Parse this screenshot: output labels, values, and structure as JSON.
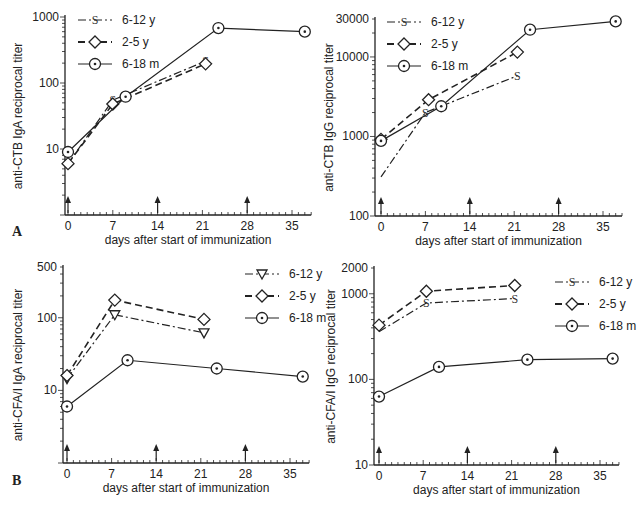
{
  "figure": {
    "panel_labels": [
      "A",
      "B"
    ],
    "shared_xlabel": "days after start of immunization",
    "x_ticks": [
      "0",
      "7",
      "14",
      "21",
      "28",
      "35"
    ],
    "immunization_arrows_days": [
      0,
      14,
      28
    ]
  },
  "chart_data": [
    {
      "id": "A-left",
      "type": "line",
      "title": "",
      "xlabel": "days after start of immunization",
      "ylabel": "anti-CTB IgA reciprocal titer",
      "yscale": "log",
      "ylim": [
        1,
        1000
      ],
      "y_ticks": [
        "1000",
        "100",
        "10"
      ],
      "xlim": [
        0,
        38
      ],
      "grid": false,
      "legend_position": "upper left",
      "series": [
        {
          "name": "6-12 y",
          "marker": "S",
          "linestyle": "dash-dot",
          "x": [
            0,
            7,
            21.5
          ],
          "values": [
            6,
            55,
            215
          ]
        },
        {
          "name": "2-5 y",
          "marker": "diamond",
          "linestyle": "dashed",
          "x": [
            0,
            7,
            21.5
          ],
          "values": [
            6,
            48,
            195
          ]
        },
        {
          "name": "6-18 m",
          "marker": "circle-dot",
          "linestyle": "solid",
          "x": [
            0,
            9,
            23.5,
            37
          ],
          "values": [
            9,
            62,
            680,
            600
          ]
        }
      ]
    },
    {
      "id": "A-right",
      "type": "line",
      "title": "",
      "xlabel": "days after start of immunization",
      "ylabel": "anti-CTB IgG reciprocal titer",
      "yscale": "log",
      "ylim": [
        100,
        30000
      ],
      "y_ticks": [
        "30000",
        "10000",
        "1000",
        "100"
      ],
      "xlim": [
        0,
        38
      ],
      "grid": false,
      "legend_position": "upper left",
      "series": [
        {
          "name": "6-12 y",
          "marker": "S",
          "linestyle": "dash-dot",
          "x": [
            0,
            7,
            21.5
          ],
          "values": [
            310,
            2000,
            5800
          ]
        },
        {
          "name": "2-5 y",
          "marker": "diamond",
          "linestyle": "dashed",
          "x": [
            0,
            7.5,
            21.5
          ],
          "values": [
            920,
            2900,
            11500
          ]
        },
        {
          "name": "6-18 m",
          "marker": "circle-dot",
          "linestyle": "solid",
          "x": [
            0,
            9.5,
            23.5,
            37
          ],
          "values": [
            880,
            2400,
            22000,
            28000
          ]
        }
      ]
    },
    {
      "id": "B-left",
      "type": "line",
      "title": "",
      "xlabel": "days after start of immunization",
      "ylabel": "anti-CFA/I IgA reciprocal titer",
      "yscale": "log",
      "ylim": [
        1,
        500
      ],
      "y_ticks": [
        "500",
        "100",
        "10"
      ],
      "xlim": [
        0,
        38
      ],
      "grid": false,
      "legend_position": "upper right",
      "series": [
        {
          "name": "6-12 y",
          "marker": "triangle-down",
          "linestyle": "dash-dot",
          "x": [
            0,
            7.5,
            21.5
          ],
          "values": [
            14.5,
            110,
            62
          ]
        },
        {
          "name": "2-5 y",
          "marker": "diamond",
          "linestyle": "dashed",
          "x": [
            0,
            7.5,
            21.5
          ],
          "values": [
            16,
            175,
            95
          ]
        },
        {
          "name": "6-18 m",
          "marker": "circle-dot",
          "linestyle": "solid",
          "x": [
            0,
            9.5,
            23.5,
            37
          ],
          "values": [
            6,
            26,
            20,
            15.5
          ]
        }
      ]
    },
    {
      "id": "B-right",
      "type": "line",
      "title": "",
      "xlabel": "days after start of immunization",
      "ylabel": "anti-CFA/I IgG reciprocal titer",
      "yscale": "log",
      "ylim": [
        10,
        2000
      ],
      "y_ticks": [
        "2000",
        "1000",
        "100",
        "10"
      ],
      "xlim": [
        0,
        38
      ],
      "grid": false,
      "legend_position": "upper right",
      "series": [
        {
          "name": "6-12 y",
          "marker": "S",
          "linestyle": "dash-dot",
          "x": [
            0,
            7.5,
            21.5
          ],
          "values": [
            360,
            780,
            880
          ]
        },
        {
          "name": "2-5 y",
          "marker": "diamond",
          "linestyle": "dashed",
          "x": [
            0,
            7.5,
            21.5
          ],
          "values": [
            430,
            1070,
            1250
          ]
        },
        {
          "name": "6-18 m",
          "marker": "circle-dot",
          "linestyle": "solid",
          "x": [
            0,
            9.5,
            23.5,
            37
          ],
          "values": [
            63,
            140,
            170,
            175
          ]
        }
      ]
    }
  ]
}
